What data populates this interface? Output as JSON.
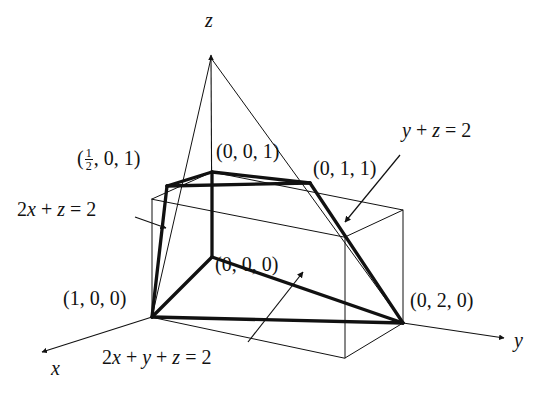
{
  "figure": {
    "type": "3d-solid-region-diagram",
    "background_color": "#ffffff",
    "line_color": "#111111",
    "thick_line_width": 3.2,
    "thin_line_width": 1.0
  },
  "axes": [
    {
      "name": "x-axis",
      "label": "x",
      "direction": "lower-left"
    },
    {
      "name": "y-axis",
      "label": "y",
      "direction": "lower-right"
    },
    {
      "name": "z-axis",
      "label": "z",
      "direction": "up"
    }
  ],
  "axis_labels": {
    "x": "x",
    "y": "y",
    "z": "z"
  },
  "vertex_labels": [
    {
      "name": "vertex-half-0-1",
      "text": "(",
      "fraction_num": "1",
      "fraction_den": "2",
      "rest": ", 0, 1)"
    },
    {
      "name": "vertex-0-0-1",
      "text": "(0, 0, 1)"
    },
    {
      "name": "vertex-0-1-1",
      "text": "(0, 1, 1)"
    },
    {
      "name": "vertex-0-0-0",
      "text": "(0, 0, 0)"
    },
    {
      "name": "vertex-1-0-0",
      "text": "(1, 0, 0)"
    },
    {
      "name": "vertex-0-2-0",
      "text": "(0, 2, 0)"
    }
  ],
  "plane_equations": [
    {
      "name": "plane-2x-plus-z",
      "lhs": "2x + z",
      "rhs": "2",
      "text": "2x + z = 2"
    },
    {
      "name": "plane-y-plus-z",
      "lhs": "y + z",
      "rhs": "2",
      "text": "y + z = 2"
    },
    {
      "name": "plane-2x-plus-y-plus-z",
      "lhs": "2x + y + z",
      "rhs": "2",
      "text": "2x + y + z = 2"
    }
  ],
  "labels": {
    "half_0_1_prefix": "(",
    "half_0_1_suffix": ", 0, 1)",
    "half_num": "1",
    "half_den": "2",
    "p001": "(0, 0, 1)",
    "p011": "(0, 1, 1)",
    "p000": "(0, 0, 0)",
    "p100": "(1, 0, 0)",
    "p020": "(0, 2, 0)",
    "eq_2x_z": "2x + z = 2",
    "eq_y_z": "y + z = 2",
    "eq_2x_y_z": "2x + y + z = 2",
    "eq_2x_z_a": "2",
    "eq_2x_z_x": "x",
    "eq_2x_z_b": " + ",
    "eq_2x_z_z": "z",
    "eq_2x_z_c": " = 2",
    "eq_y_z_y": "y",
    "eq_y_z_b": " + ",
    "eq_y_z_z": "z",
    "eq_y_z_c": " = 2",
    "eq_all_a": "2",
    "eq_all_x": "x",
    "eq_all_b": " + ",
    "eq_all_y": "y",
    "eq_all_c": " + ",
    "eq_all_z": "z",
    "eq_all_d": " = 2"
  },
  "geometry": {
    "projected_points": {
      "origin": [
        212,
        257
      ],
      "v100": [
        152,
        317
      ],
      "v020": [
        403,
        323
      ],
      "v001": [
        212,
        172
      ],
      "v_half01": [
        167,
        186
      ],
      "v011": [
        310,
        183
      ],
      "z_apex_2": [
        211,
        58
      ],
      "box_back_bottom": [
        212,
        257
      ],
      "box_left_bottom": [
        152,
        317
      ],
      "box_right_bottom": [
        403,
        323
      ],
      "box_front_bottom": [
        345,
        358
      ],
      "box_back_top": [
        212,
        172
      ],
      "box_left_top": [
        152,
        199
      ],
      "box_right_top": [
        403,
        210
      ],
      "box_front_top": [
        345,
        237
      ]
    },
    "axis_tips": {
      "x": [
        38,
        355
      ],
      "y": [
        508,
        338
      ],
      "z": [
        211,
        50
      ]
    }
  }
}
